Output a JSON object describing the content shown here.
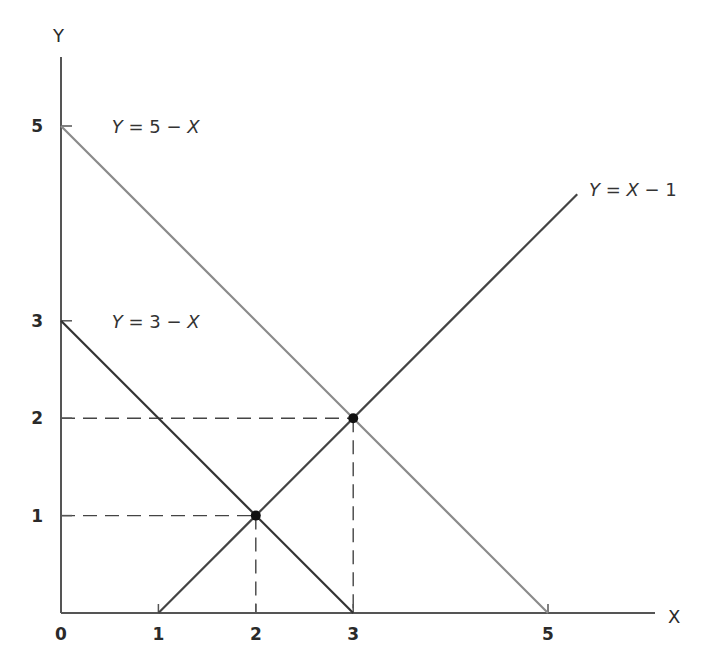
{
  "chart_data": {
    "type": "line",
    "title": "",
    "xlabel": "X",
    "ylabel": "Y",
    "xlim": [
      0,
      5.8
    ],
    "ylim": [
      0,
      5.8
    ],
    "grid": false,
    "x_ticks": [
      {
        "value": 0,
        "label": "0"
      },
      {
        "value": 1,
        "label": "1"
      },
      {
        "value": 2,
        "label": "2"
      },
      {
        "value": 3,
        "label": "3"
      },
      {
        "value": 5,
        "label": "5"
      }
    ],
    "y_ticks": [
      {
        "value": 1,
        "label": "1"
      },
      {
        "value": 2,
        "label": "2"
      },
      {
        "value": 3,
        "label": "3"
      },
      {
        "value": 5,
        "label": "5"
      }
    ],
    "series": [
      {
        "name": "Y = 5 − X",
        "label_parts": [
          "Y",
          " = 5 − ",
          "X"
        ],
        "color": "#8a8a8a",
        "points": [
          [
            0,
            5
          ],
          [
            5,
            0
          ]
        ],
        "label_anchor": [
          0.5,
          5.0
        ]
      },
      {
        "name": "Y = 3 − X",
        "label_parts": [
          "Y",
          " = 3 − ",
          "X"
        ],
        "color": "#333333",
        "points": [
          [
            0,
            3
          ],
          [
            3,
            0
          ]
        ],
        "label_anchor": [
          0.5,
          3.0
        ]
      },
      {
        "name": "Y = X − 1",
        "label_parts": [
          "Y",
          " = ",
          "X",
          " − 1"
        ],
        "color": "#444444",
        "points": [
          [
            1,
            0
          ],
          [
            5.3,
            4.3
          ]
        ],
        "label_anchor": [
          5.4,
          4.35
        ]
      }
    ],
    "intersections": [
      {
        "x": 2,
        "y": 1
      },
      {
        "x": 3,
        "y": 2
      }
    ],
    "guide_lines": [
      {
        "x": 2,
        "y": 1
      },
      {
        "x": 3,
        "y": 2
      }
    ]
  }
}
